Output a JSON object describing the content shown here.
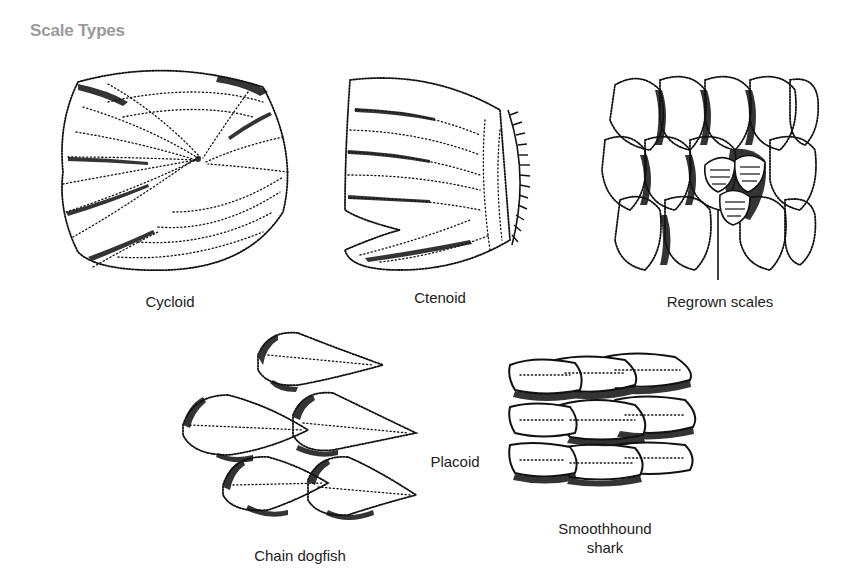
{
  "figure": {
    "title": "Scale Types",
    "title_color": "#9a9a9a"
  },
  "illustrations": [
    {
      "id": "cycloid",
      "label": "Cycloid"
    },
    {
      "id": "ctenoid",
      "label": "Ctenoid"
    },
    {
      "id": "regrown",
      "label": "Regrown scales"
    },
    {
      "id": "placoid-group",
      "label": "Placoid"
    },
    {
      "id": "chain-dogfish",
      "label": "Chain dogfish"
    },
    {
      "id": "smoothhound",
      "label_line1": "Smoothhound",
      "label_line2": "shark"
    }
  ]
}
